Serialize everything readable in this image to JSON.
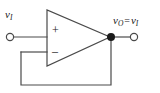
{
  "figure": {
    "background_color": "#ffffff",
    "line_color": "#4a4a4a",
    "text_color": "#1a1a1a",
    "width": 160,
    "height": 93
  },
  "labels": {
    "input": {
      "symbol": "v",
      "subscript": "I"
    },
    "output": {
      "symbol": "v",
      "subscript": "O",
      "relation": "=",
      "symbol2": "v",
      "subscript2": "I"
    }
  },
  "opamp": {
    "noninverting_sign": "+",
    "inverting_sign": "–",
    "apex_x": 110,
    "left_edge_x": 47,
    "top_y": 10,
    "bottom_y": 66
  },
  "terminals": {
    "input_node": {
      "x": 10,
      "y": 37,
      "type": "open-circle"
    },
    "output_node": {
      "x": 134,
      "y": 37,
      "type": "open-circle"
    },
    "junction": {
      "x": 111,
      "y": 37,
      "type": "filled-dot"
    }
  },
  "wires": {
    "input_wire": "from input terminal (10,37) to non-inverting input (47,37)",
    "output_wire": "from apex (110,37) through junction (111,37) to output terminal (134,37)",
    "feedback_wire": "from junction (111,37) down to (111,85), left to (21,85), up to (21,52), right to inverting input (47,52)"
  }
}
